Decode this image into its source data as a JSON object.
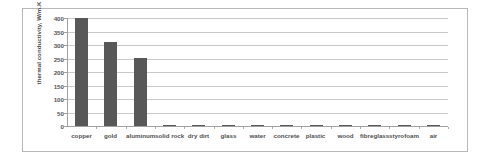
{
  "chart_data": {
    "type": "bar",
    "title": "",
    "xlabel": "",
    "ylabel": "thermal conductivity, W/m.K",
    "ylim": [
      0,
      400
    ],
    "ytick_labels": [
      "400",
      "350",
      "300",
      "250",
      "200",
      "150",
      "100",
      "50",
      "0"
    ],
    "ytick_values": [
      400,
      350,
      300,
      250,
      200,
      150,
      100,
      50,
      0
    ],
    "grid": true,
    "legend": "none",
    "bar_color": "#585858",
    "gridline_color": "#c9c9c9",
    "axis_color": "#a0a0a0",
    "frame_color": "#b8b8b8",
    "categories": [
      "copper",
      "gold",
      "aluminum",
      "solid rock",
      "dry dirt",
      "glass",
      "water",
      "concrete",
      "plastic",
      "wood",
      "fibreglass",
      "styrofoam",
      "air"
    ],
    "values": [
      400,
      310,
      250,
      3,
      0.8,
      0.8,
      0.6,
      0.8,
      0.4,
      0.15,
      0.04,
      0.03,
      0.025
    ]
  }
}
